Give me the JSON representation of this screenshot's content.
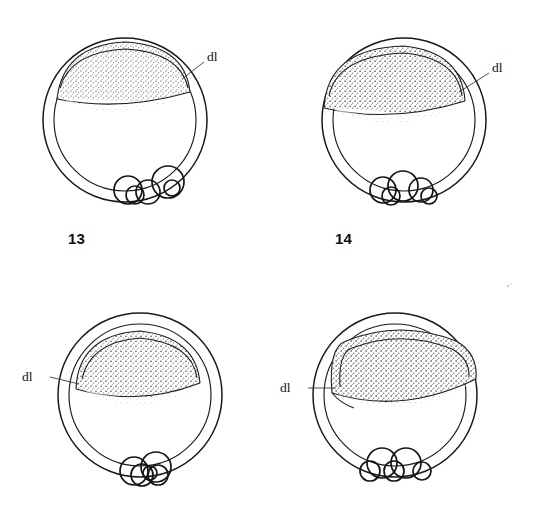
{
  "figure": {
    "kind": "scientific-line-drawing-plate",
    "background_color": "#ffffff",
    "ink_color": "#1a1a1a",
    "columns": 2,
    "rows": 2
  },
  "panels": [
    {
      "id": "panel-13",
      "caption": "13",
      "caption_visible": true,
      "label": "dl",
      "label_side": "right",
      "label_meaning": "dorsal lip",
      "stage_note": "early gastrula, thin crescent cap, dorsal lip at right",
      "center_x": 125,
      "center_y": 120,
      "outer_radius": 82,
      "inner_radius": 71,
      "cap_thickness": "thin",
      "yolk_cells": 4
    },
    {
      "id": "panel-14",
      "caption": "14",
      "caption_visible": true,
      "label": "dl",
      "label_side": "right",
      "label_meaning": "dorsal lip",
      "stage_note": "cap broadened and coarsely stippled, dorsal lip at right",
      "center_x": 404,
      "center_y": 120,
      "outer_radius": 82,
      "inner_radius": 71,
      "cap_thickness": "medium",
      "yolk_cells": 4
    },
    {
      "id": "panel-15",
      "caption": "",
      "caption_visible": false,
      "label": "dl",
      "label_side": "left",
      "label_meaning": "dorsal lip",
      "stage_note": "cap tilted, dorsal lip now marked on the left side",
      "center_x": 140,
      "center_y": 395,
      "outer_radius": 82,
      "inner_radius": 71,
      "cap_thickness": "medium",
      "yolk_cells": 4
    },
    {
      "id": "panel-16",
      "caption": "",
      "caption_visible": false,
      "label": "dl",
      "label_side": "left",
      "label_meaning": "dorsal lip",
      "stage_note": "thickened involuting cap with pointed dorsal lip at left",
      "center_x": 395,
      "center_y": 395,
      "outer_radius": 82,
      "inner_radius": 71,
      "cap_thickness": "thick",
      "yolk_cells": 4
    }
  ],
  "legend": {
    "abbreviation": "dl",
    "expansion": "dorsal lip"
  }
}
